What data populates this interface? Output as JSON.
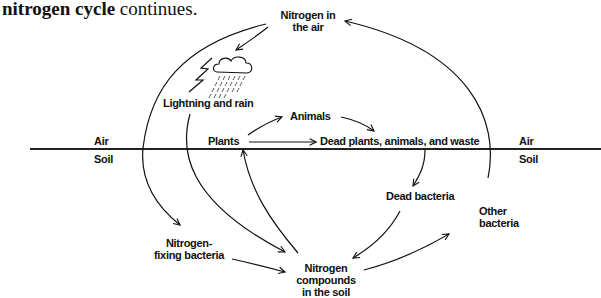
{
  "intro": {
    "bold": "nitrogen cycle",
    "rest": " continues."
  },
  "diagram": {
    "title": "Nitrogen cycle",
    "boundary": {
      "left_air": "Air",
      "left_soil": "Soil",
      "right_air": "Air",
      "right_soil": "Soil"
    },
    "nodes": {
      "nitrogen_air": {
        "line1": "Nitrogen in",
        "line2": "the air"
      },
      "lightning_rain": "Lightning and rain",
      "animals": "Animals",
      "plants": "Plants",
      "dead_matter": "Dead plants, animals, and waste",
      "dead_bacteria": "Dead bacteria",
      "other_bacteria": {
        "line1": "Other",
        "line2": "bacteria"
      },
      "fixing_bacteria": {
        "line1": "Nitrogen-",
        "line2": "fixing bacteria"
      },
      "soil_compounds": {
        "line1": "Nitrogen",
        "line2": "compounds",
        "line3": "in the soil"
      }
    },
    "edges": [
      {
        "from": "Nitrogen in the air",
        "to": "Lightning and rain"
      },
      {
        "from": "Nitrogen in the air",
        "to": "Nitrogen-fixing bacteria"
      },
      {
        "from": "Lightning and rain",
        "to": "Nitrogen compounds in the soil"
      },
      {
        "from": "Plants",
        "to": "Animals"
      },
      {
        "from": "Plants",
        "to": "Dead plants, animals, and waste"
      },
      {
        "from": "Animals",
        "to": "Dead plants, animals, and waste"
      },
      {
        "from": "Dead plants, animals, and waste",
        "to": "Dead bacteria"
      },
      {
        "from": "Dead bacteria",
        "to": "Nitrogen compounds in the soil"
      },
      {
        "from": "Nitrogen-fixing bacteria",
        "to": "Nitrogen compounds in the soil"
      },
      {
        "from": "Nitrogen compounds in the soil",
        "to": "Plants"
      },
      {
        "from": "Nitrogen compounds in the soil",
        "to": "Other bacteria"
      },
      {
        "from": "Other bacteria",
        "to": "Nitrogen in the air"
      }
    ]
  }
}
